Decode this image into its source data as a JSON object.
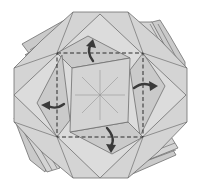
{
  "diagram": {
    "type": "origami-folding-step",
    "colors": {
      "paper": "#d4d4d4",
      "paper_shadow": "#cacaca",
      "outline": "#6e6e6e",
      "valley_fold_line": "#2a2a2a",
      "arrow": "#3a3a3a",
      "background": "#ffffff"
    },
    "elements": {
      "valley_fold_square": {
        "style": "dashed",
        "corners": [
          [
            57,
            53
          ],
          [
            143,
            53
          ],
          [
            143,
            137
          ],
          [
            57,
            137
          ]
        ]
      },
      "center_point": [
        100,
        95
      ],
      "radial_creases": 8,
      "arrows": [
        {
          "position": "top",
          "direction": "fold-up"
        },
        {
          "position": "right",
          "direction": "fold-right"
        },
        {
          "position": "bottom",
          "direction": "fold-down"
        },
        {
          "position": "left",
          "direction": "fold-left"
        }
      ]
    }
  }
}
